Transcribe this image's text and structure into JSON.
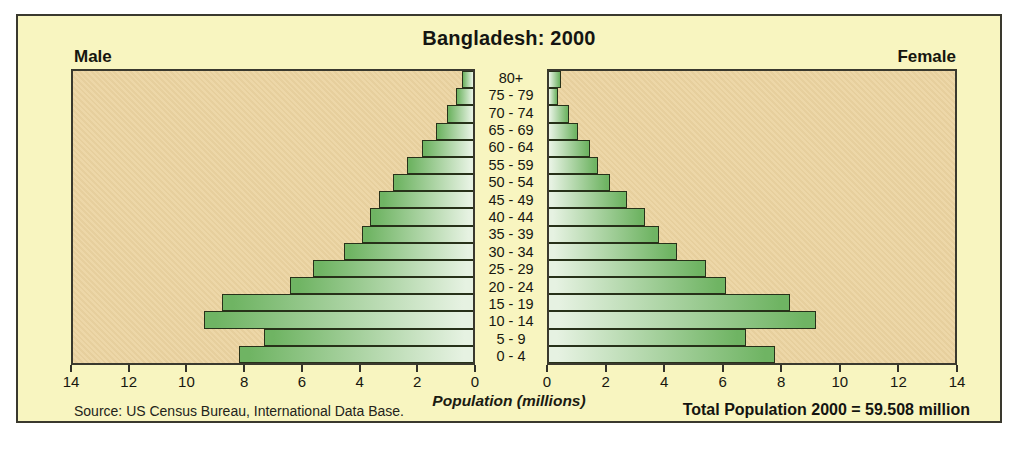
{
  "chart_data": {
    "type": "bar",
    "subtype": "population_pyramid",
    "title": "Bangladesh: 2000",
    "left_header": "Male",
    "right_header": "Female",
    "xlabel": "Population (millions)",
    "x_max": 14,
    "x_tick_step": 2,
    "male_axis_ticks": [
      "14",
      "12",
      "10",
      "8",
      "6",
      "4",
      "2",
      "0"
    ],
    "female_axis_ticks": [
      "0",
      "2",
      "4",
      "6",
      "8",
      "10",
      "12",
      "14"
    ],
    "age_groups_top_down": [
      "80+",
      "75 - 79",
      "70 - 74",
      "65 - 69",
      "60 - 64",
      "55 - 59",
      "50 - 54",
      "45 - 49",
      "40 - 44",
      "35 - 39",
      "30 - 34",
      "25 - 29",
      "20 - 24",
      "15 - 19",
      "10 - 14",
      "5 - 9",
      "0 - 4"
    ],
    "series": [
      {
        "name": "Male",
        "values_top_down": [
          0.4,
          0.6,
          0.9,
          1.3,
          1.8,
          2.3,
          2.8,
          3.3,
          3.6,
          3.9,
          4.5,
          5.6,
          6.4,
          8.8,
          9.4,
          7.3,
          8.2
        ]
      },
      {
        "name": "Female",
        "values_top_down": [
          0.4,
          0.3,
          0.7,
          1.0,
          1.4,
          1.7,
          2.1,
          2.7,
          3.3,
          3.8,
          4.4,
          5.4,
          6.1,
          8.3,
          9.2,
          6.8,
          7.8
        ]
      }
    ],
    "footer": {
      "source": "Source: US  Census Bureau, International Data Base.",
      "total": "Total Population 2000 = 59.508 million"
    },
    "colors": {
      "page_background": "#ffffff",
      "box_background": "#f8f5c0",
      "panel_background": "#ecd4a1",
      "bar_green": "#6fb463",
      "bar_light": "#e6f2e2",
      "border_dark": "#3a392e"
    }
  }
}
